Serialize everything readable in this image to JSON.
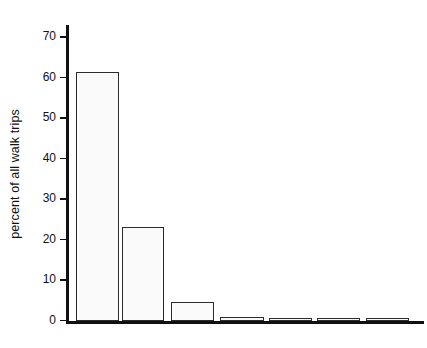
{
  "chart_data": {
    "type": "bar",
    "title": "",
    "xlabel": "",
    "ylabel": "percent of all walk trips",
    "ylim": [
      0,
      73
    ],
    "yticks": [
      0,
      10,
      20,
      30,
      40,
      50,
      60,
      70
    ],
    "ytick_labels": [
      "0",
      "10",
      "20",
      "30",
      "40",
      "50",
      "60",
      "70"
    ],
    "grid": false,
    "legend": false,
    "categories": [
      "1",
      "2",
      "3",
      "4",
      "5",
      "6",
      "7"
    ],
    "values": [
      61.3,
      23.2,
      4.8,
      1.1,
      0.5,
      0.4,
      0.3
    ],
    "bars": [
      {
        "name": "bar-1",
        "value": 61.3,
        "x_px": 76,
        "width_px": 43
      },
      {
        "name": "bar-2",
        "value": 23.2,
        "x_px": 122,
        "width_px": 42
      },
      {
        "name": "bar-3",
        "value": 4.8,
        "x_px": 171,
        "width_px": 43
      },
      {
        "name": "bar-4",
        "value": 1.1,
        "x_px": 220,
        "width_px": 44
      },
      {
        "name": "bar-5",
        "value": 0.5,
        "x_px": 269,
        "width_px": 43
      },
      {
        "name": "bar-6",
        "value": 0.4,
        "x_px": 317,
        "width_px": 43
      },
      {
        "name": "bar-7",
        "value": 0.3,
        "x_px": 366,
        "width_px": 43
      }
    ]
  },
  "colors": {
    "bar_fill": "#fafafa",
    "bar_stroke": "#2b2b2b",
    "axis": "#101010",
    "text": "#111111",
    "background": "#ffffff"
  }
}
